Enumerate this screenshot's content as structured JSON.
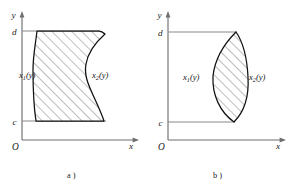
{
  "figure": {
    "ink_color": "#111111",
    "axis_color": "#6f6f6f",
    "level_line_color": "#8a8a8a",
    "hatch_color": "#2a2a2a",
    "background_color": "#ffffff"
  },
  "panels": [
    {
      "id": "panel-a",
      "caption": "a )",
      "axes": {
        "y_axis_label": "y",
        "x_axis_label": "x",
        "origin_label": "O",
        "upper_tick_label": "d",
        "lower_tick_label": "c"
      },
      "region": {
        "left_curve_label_base": "x",
        "left_curve_label_sub": "1",
        "left_curve_label_arg": "(y)",
        "right_curve_label_base": "x",
        "right_curve_label_sub": "2",
        "right_curve_label_arg": "(y)",
        "shape": "flat top at y=d and flat bottom at y=c; left boundary a gentle nearly-vertical S-curve; right boundary a strong S-curve bulging right near the top, pinching inward below the middle, then bulging right again at the bottom",
        "hatch_direction": "lower-left to upper-right"
      }
    },
    {
      "id": "panel-b",
      "caption": "b )",
      "axes": {
        "y_axis_label": "y",
        "x_axis_label": "x",
        "origin_label": "O",
        "upper_tick_label": "d",
        "lower_tick_label": "c"
      },
      "region": {
        "left_curve_label_base": "x",
        "left_curve_label_sub": "1",
        "left_curve_label_arg": "(y)",
        "right_curve_label_base": "x",
        "right_curve_label_sub": "2",
        "right_curve_label_arg": "(y)",
        "shape": "lens / eye shape; left boundary bows left and right boundary bows right, meeting at single points at y=d and y=c",
        "hatch_direction": "lower-left to upper-right"
      }
    }
  ]
}
